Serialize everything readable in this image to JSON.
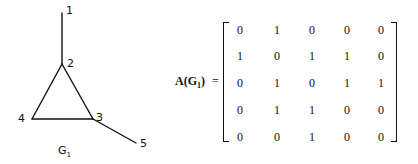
{
  "graph": {
    "name": "G",
    "subscript": "1",
    "vertices": [
      {
        "id": "1",
        "x": 62,
        "y": 13
      },
      {
        "id": "2",
        "x": 62,
        "y": 64
      },
      {
        "id": "3",
        "x": 93,
        "y": 119
      },
      {
        "id": "4",
        "x": 32,
        "y": 119
      },
      {
        "id": "5",
        "x": 136,
        "y": 143
      }
    ],
    "edges": [
      [
        "1",
        "2"
      ],
      [
        "2",
        "3"
      ],
      [
        "2",
        "4"
      ],
      [
        "3",
        "4"
      ],
      [
        "3",
        "5"
      ]
    ]
  },
  "matrix": {
    "label_prefix": "A(G",
    "label_subscript": "1",
    "label_suffix": ")",
    "equals": "=",
    "rows": [
      [
        "0",
        "1",
        "0",
        "0",
        "0"
      ],
      [
        "1",
        "0",
        "1",
        "1",
        "0"
      ],
      [
        "0",
        "1",
        "0",
        "1",
        "1"
      ],
      [
        "0",
        "1",
        "1",
        "0",
        "0"
      ],
      [
        "0",
        "0",
        "1",
        "0",
        "0"
      ]
    ]
  }
}
